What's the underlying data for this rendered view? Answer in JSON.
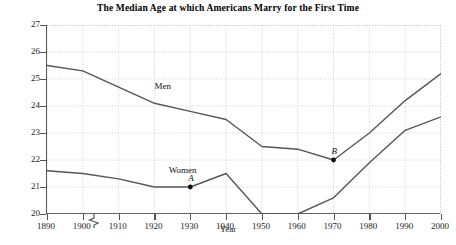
{
  "chart_data": {
    "type": "line",
    "title": "The Median Age at which Americans Marry for the First Time",
    "xlabel": "Year",
    "ylabel": "Age",
    "x": [
      1890,
      1900,
      1910,
      1920,
      1930,
      1940,
      1950,
      1960,
      1970,
      1980,
      1990,
      2000
    ],
    "xtick_labels": [
      "1890",
      "1900",
      "1910",
      "1920",
      "1930",
      "1940",
      "1950",
      "1960",
      "1970",
      "1980",
      "1990",
      "2000"
    ],
    "ytick_labels": [
      "20",
      "21",
      "22",
      "23",
      "24",
      "25",
      "26",
      "27"
    ],
    "xlim": [
      1890,
      2000
    ],
    "ylim": [
      20,
      27
    ],
    "grid": true,
    "legend_position": "inline-labels",
    "y_axis_break": true,
    "series": [
      {
        "name": "Men",
        "label": "Men",
        "label_x": 1920,
        "label_y": 24.7,
        "color": "#555555",
        "values": [
          25.5,
          25.3,
          24.7,
          24.1,
          23.8,
          23.5,
          22.5,
          22.4,
          22.0,
          23.0,
          24.2,
          25.2
        ]
      },
      {
        "name": "Women",
        "label": "Women",
        "label_x": 1924,
        "label_y": 21.6,
        "color": "#555555",
        "values": [
          21.6,
          21.5,
          21.3,
          21.0,
          21.0,
          21.5,
          20.0,
          20.0,
          20.6,
          21.9,
          23.1,
          23.6
        ]
      }
    ],
    "annotations": [
      {
        "label": "A",
        "x": 1930,
        "y": 21.0,
        "series": "Women",
        "marker": "dot"
      },
      {
        "label": "B",
        "x": 1970,
        "y": 22.0,
        "series": "Men",
        "marker": "dot"
      }
    ]
  },
  "caption": ""
}
